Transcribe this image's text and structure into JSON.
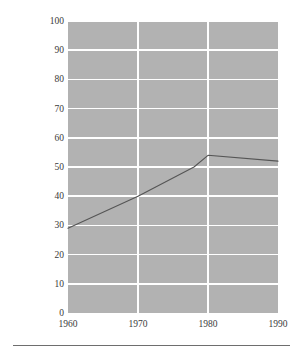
{
  "chart_data": {
    "type": "line",
    "title": "",
    "subtitle": "",
    "xlabel": "",
    "ylabel_line1": "Total Federal Expenditures for Social Welfare",
    "ylabel_line2": "as Percent of Total Federal Government Outlays",
    "ylabel": "Total Federal Expenditures for Social Welfare as Percent of Total Federal Government Outlays",
    "x": [
      1960,
      1970,
      1980,
      1990
    ],
    "xlim": [
      1960,
      1990
    ],
    "ylim": [
      0,
      100
    ],
    "xticks": [
      "1960",
      "1970",
      "1980",
      "1990"
    ],
    "yticks": [
      "0",
      "10",
      "20",
      "30",
      "40",
      "50",
      "60",
      "70",
      "80",
      "90",
      "100"
    ],
    "ytick_values": [
      0,
      10,
      20,
      30,
      40,
      50,
      60,
      70,
      80,
      90,
      100
    ],
    "xtick_values": [
      1960,
      1970,
      1980,
      1990
    ],
    "series": [
      {
        "name": "Federal social welfare share of outlays",
        "points": [
          {
            "x": 1960,
            "y": 29
          },
          {
            "x": 1970,
            "y": 40
          },
          {
            "x": 1978,
            "y": 50
          },
          {
            "x": 1980,
            "y": 54
          },
          {
            "x": 1990,
            "y": 52
          }
        ],
        "values": [
          29,
          40,
          54,
          52
        ],
        "color": "#555555"
      }
    ],
    "grid": true,
    "grid_color": "#ffffff",
    "plot_background": "#b2b2b2",
    "legend": null,
    "legend_position": "none",
    "annotations": []
  }
}
